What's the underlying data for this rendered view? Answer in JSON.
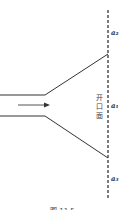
{
  "diagram": {
    "labels": {
      "top": "a₂",
      "middle": "a₁",
      "bottom": "a₃",
      "aperture": [
        "开",
        "口",
        "面"
      ],
      "caption": "图 11.5"
    },
    "colors": {
      "line": "#333333",
      "dash": "#444444",
      "background": "#ffffff"
    }
  }
}
